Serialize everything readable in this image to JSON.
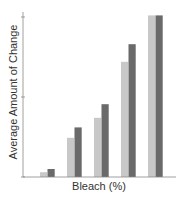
{
  "chart_data": {
    "type": "bar",
    "title": "",
    "xlabel": "Bleach (%)",
    "ylabel": "Average Amount of Change",
    "categories": [
      "1",
      "2",
      "3",
      "4",
      "5"
    ],
    "tick_labels_shown": false,
    "series": [
      {
        "name": "Series A (light)",
        "color": "#c8c8c8",
        "values": [
          0.06,
          0.49,
          0.74,
          1.44,
          2.02
        ]
      },
      {
        "name": "Series B (dark)",
        "color": "#6a6a6a",
        "values": [
          0.1,
          0.62,
          0.91,
          1.66,
          2.02
        ]
      }
    ],
    "ylim": [
      0,
      2.1
    ],
    "yticks": [
      0,
      1,
      2
    ],
    "grid": false,
    "legend": "none"
  }
}
